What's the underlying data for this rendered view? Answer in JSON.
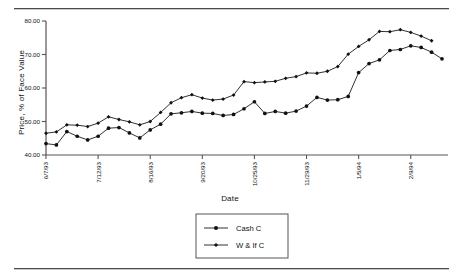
{
  "figure": {
    "rule_top": "",
    "rule_bottom": ""
  },
  "chart_data": {
    "type": "line",
    "title": "",
    "xlabel": "Date",
    "ylabel": "Price, % of Face Value",
    "ylim": [
      40.0,
      80.0
    ],
    "yticks": [
      40.0,
      50.0,
      60.0,
      70.0,
      80.0
    ],
    "ytick_labels": [
      "40.00",
      "50.00",
      "60.00",
      "70.00",
      "80.00"
    ],
    "grid": false,
    "legend_position": "bottom-center",
    "xtick_labels": [
      "6/7/93",
      "7/12/93",
      "8/16/93",
      "9/20/93",
      "10/25/93",
      "11/29/93",
      "1/5/94",
      "2/9/94"
    ],
    "xtick_indices": [
      0,
      5,
      10,
      15,
      20,
      25,
      30,
      35
    ],
    "x_count": 41,
    "series": [
      {
        "name": "Cash C",
        "marker": "circle",
        "values": [
          43.4,
          43.0,
          47.0,
          45.6,
          44.5,
          45.6,
          48.0,
          48.2,
          46.6,
          45.1,
          47.5,
          49.2,
          52.3,
          52.6,
          53.0,
          52.5,
          52.4,
          51.8,
          52.1,
          53.8,
          55.9,
          52.4,
          53.0,
          52.5,
          53.1,
          54.6,
          57.2,
          56.4,
          56.5,
          57.5,
          64.6,
          67.3,
          68.4,
          71.2,
          71.5,
          72.6,
          72.1,
          70.7,
          68.7
        ]
      },
      {
        "name": "W & If  C",
        "marker": "diamond",
        "values": [
          46.5,
          46.9,
          49.0,
          48.9,
          48.5,
          49.5,
          51.4,
          50.6,
          49.9,
          49.0,
          50.0,
          52.7,
          55.6,
          57.1,
          58.0,
          57.0,
          56.4,
          56.7,
          57.9,
          61.9,
          61.6,
          61.8,
          62.0,
          62.9,
          63.4,
          64.5,
          64.4,
          65.0,
          66.4,
          70.1,
          72.4,
          74.4,
          76.9,
          76.8,
          77.4,
          76.6,
          75.5,
          74.1
        ]
      }
    ]
  },
  "legend": {
    "entries": [
      {
        "label": "Cash C"
      },
      {
        "label": "W & If  C"
      }
    ]
  }
}
